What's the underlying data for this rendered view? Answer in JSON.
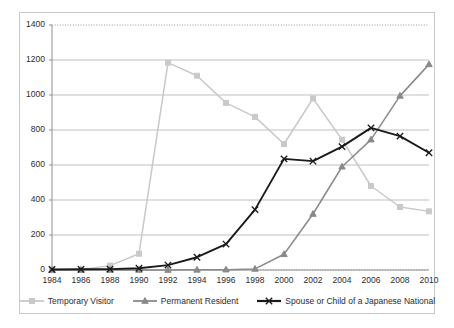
{
  "chart_data": {
    "type": "line",
    "title": "",
    "xlabel": "",
    "ylabel": "",
    "categories": [
      1984,
      1986,
      1988,
      1990,
      1992,
      1994,
      1996,
      1998,
      2000,
      2002,
      2004,
      2006,
      2008,
      2010
    ],
    "xtick_labels": [
      "1984",
      "1986",
      "1988",
      "1990",
      "1992",
      "1994",
      "1996",
      "1998",
      "2000",
      "2002",
      "2004",
      "2006",
      "2008",
      "2010"
    ],
    "ytick_labels": [
      "0",
      "200",
      "400",
      "600",
      "800",
      "1000",
      "1200",
      "1400"
    ],
    "ytick_values": [
      0,
      200,
      400,
      600,
      800,
      1000,
      1200,
      1400
    ],
    "ylim": [
      0,
      1400
    ],
    "grid": true,
    "grid_axis": "y",
    "legend_position": "bottom",
    "series": [
      {
        "name": "Temporary Visitor",
        "color": "#c9c9c9",
        "marker": "square",
        "values": [
          2,
          3,
          25,
          93,
          1185,
          1110,
          955,
          875,
          720,
          980,
          745,
          480,
          360,
          335
        ]
      },
      {
        "name": "Permanent Resident",
        "color": "#8a8a8a",
        "marker": "triangle",
        "values": [
          0,
          0,
          0,
          0,
          0,
          1,
          2,
          6,
          90,
          320,
          590,
          745,
          995,
          1175
        ]
      },
      {
        "name": "Spouse or Child of a Japanese National",
        "color": "#1a1a1a",
        "marker": "cross",
        "values": [
          3,
          4,
          5,
          10,
          28,
          73,
          148,
          345,
          635,
          622,
          705,
          812,
          765,
          670
        ]
      }
    ]
  },
  "legend": {
    "items": [
      {
        "label": "Temporary Visitor"
      },
      {
        "label": "Permanent Resident"
      },
      {
        "label": "Spouse or Child of a Japanese National"
      }
    ]
  }
}
